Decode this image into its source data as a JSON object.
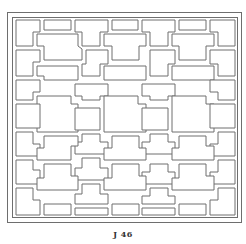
{
  "figure": {
    "caption": "J 46",
    "colors": {
      "line": "#6e6e6e",
      "background": "#ffffff",
      "caption": "#333333"
    },
    "outer_frame": {
      "x": 7.5,
      "y": 12.5,
      "w": 234,
      "h": 210
    },
    "inner_frame": {
      "x": 12.5,
      "y": 17.5,
      "w": 225,
      "h": 200
    },
    "panels": [
      "16,20 40,20 40,32 33,32 33,46 16,46",
      "44,20 71,20 71,30 44,30",
      "75,20 108,20 108,32 100,32 100,46 82,46 82,32 75,32",
      "112,20 138,20 138,30 112,30",
      "142,20 175,20 175,32 168,32 168,46 150,46 150,32 142,32",
      "179,20 206,20 206,30 179,30",
      "210,20 235,20 235,46 218,46 218,32 210,32",
      "37,34 78,34 78,46 82,49 82,60 44,60 44,46 37,46",
      "104,34 146,34 146,46 139,46 139,60 112,60 112,46 104,46",
      "172,34 214,34 214,46 206,46 206,60 179,60 179,46 172,46",
      "16,50 40,50 40,62 33,62 33,76 16,76",
      "86,50 108,50 108,64 100,64 100,76 82,76 82,64 86,64",
      "150,50 175,50 175,64 168,64 168,76 150,76",
      "210,50 235,50 235,76 218,76 218,64 210,64",
      "37,66 78,66 78,80 44,80 44,76 37,76",
      "104,66 146,66 146,80 104,80",
      "172,66 214,66 214,80 172,80",
      "16,80 40,80 40,92 33,92 33,100 16,100",
      "75,84 108,84 108,96 100,96 100,100 82,100 82,96 75,96",
      "142,84 175,84 175,96 168,96 168,100 150,100 150,96 142,96",
      "210,80 235,80 235,100 218,100 218,92 210,92",
      "37,96 71,96 71,104 78,104 78,132 37,132",
      "104,96 138,96 138,104 146,104 146,132 104,132",
      "172,96 206,96 206,104 214,104 214,132 172,132",
      "16,104 40,104 40,128 16,128",
      "75,108 100,108 100,130 75,130",
      "142,108 168,108 168,130 142,130",
      "210,104 235,104 235,128 210,128",
      "16,132 33,132 33,144 40,144 40,156 16,156",
      "82,134 100,134 100,142 108,142 108,154 75,154 75,142 82,142",
      "150,134 168,134 168,142 175,142 175,154 142,154 142,142 150,142",
      "218,132 235,132 235,156 210,156 210,144 218,144",
      "44,136 78,136 78,146 71,146 71,160 37,160 37,148 44,148",
      "112,136 139,136 139,148 146,148 146,160 104,160 104,148 112,148",
      "179,136 206,136 206,146 214,146 214,160 172,160 172,148 179,148",
      "16,160 33,160 33,170 40,170 40,184 16,184",
      "82,158 100,158 100,168 108,168 108,180 75,180 75,168 82,168",
      "150,164 168,164 168,172 175,172 175,184 142,184 142,172 150,172",
      "218,160 235,160 235,184 210,184 210,172 218,172",
      "44,164 71,164 71,176 78,176 78,190 37,190 37,178 44,178",
      "112,164 139,164 139,176 146,176 146,190 104,190 104,178 112,178",
      "179,164 206,164 206,176 214,176 214,190 172,190 172,178 179,178",
      "16,188 33,188 33,200 40,200 40,215 16,215",
      "82,184 100,184 100,194 108,194 108,204 75,204 75,194 82,194",
      "150,188 168,188 168,196 175,196 175,204 142,204 142,196 150,196",
      "218,188 235,188 235,215 210,215 210,200 218,200",
      "44,204 71,204 71,215 44,215",
      "75,208 108,208 108,215 75,215",
      "112,204 139,204 139,215 112,215",
      "142,208 175,208 175,215 142,215",
      "179,204 206,204 206,215 179,215"
    ]
  }
}
